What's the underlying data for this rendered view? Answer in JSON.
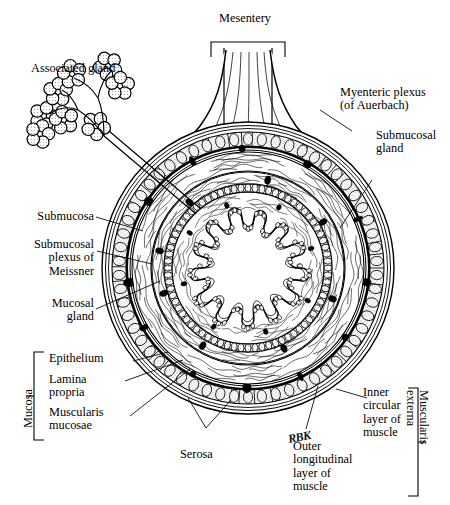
{
  "figure": {
    "signature": "RBK",
    "ink_color": "#000000",
    "background_color": "#ffffff"
  },
  "center_label": {
    "lumen": "Lumen"
  },
  "labels": {
    "mesentery": "Mesentery",
    "associated_gland": "Associated gland",
    "myenteric_plexus": "Myenteric plexus\n(of Auerbach)",
    "submucosal_gland": "Submucosal\ngland",
    "submucosa": "Submucosa",
    "submucosal_plexus": "Submucosal\nplexus of\nMeissner",
    "mucosal_gland": "Mucosal\ngland",
    "epithelium": "Epithelium",
    "lamina_propria": "Lamina\npropria",
    "muscularis_mucosae": "Muscularis\nmucosae",
    "serosa": "Serosa",
    "inner_circular": "Inner\ncircular\nlayer of\nmuscle",
    "outer_longitudinal": "Outer\nlongitudinal\nlayer of\nmuscle"
  },
  "brackets": {
    "mucosa": "Mucosa",
    "muscularis_externa": "Muscularis\nexterna"
  }
}
